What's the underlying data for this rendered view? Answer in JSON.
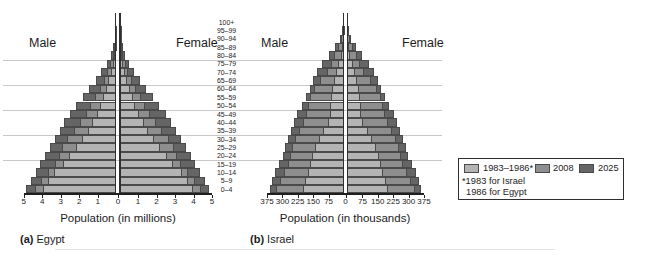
{
  "figure": {
    "age_groups": [
      "100+",
      "95–99",
      "90–94",
      "85–89",
      "80–84",
      "75–79",
      "70–74",
      "65–69",
      "60–64",
      "55–59",
      "50–54",
      "45–49",
      "40–44",
      "35–39",
      "30–34",
      "25–29",
      "20–24",
      "15–19",
      "10–14",
      "5–9",
      "0–4"
    ],
    "panels": [
      {
        "caption_prefix": "(a)",
        "caption": "Egypt",
        "male_label": "Male",
        "female_label": "Female",
        "xlabel": "Population (in millions)"
      },
      {
        "caption_prefix": "(b)",
        "caption": "Israel",
        "male_label": "Male",
        "female_label": "Female",
        "xlabel": "Population (in thousands)"
      }
    ],
    "legend": {
      "items": [
        {
          "label": "1983–1986*",
          "color": "#b4b4b4"
        },
        {
          "label": "2008",
          "color": "#8e8e8e"
        },
        {
          "label": "2025",
          "color": "#656565"
        }
      ],
      "footnote_line1": "*1983 for Israel",
      "footnote_line2": "1986 for Egypt"
    }
  },
  "chart_data": [
    {
      "type": "bar",
      "subtype": "population-pyramid",
      "id": "egypt",
      "title": "(a) Egypt",
      "xlabel": "Population (in millions)",
      "unit": "millions of persons per sex",
      "age_groups_order": "oldest-to-youngest",
      "age_groups": [
        "100+",
        "95–99",
        "90–94",
        "85–89",
        "80–84",
        "75–79",
        "70–74",
        "65–69",
        "60–64",
        "55–59",
        "50–54",
        "45–49",
        "40–44",
        "35–39",
        "30–34",
        "25–29",
        "20–24",
        "15–19",
        "10–14",
        "5–9",
        "0–4"
      ],
      "x_tick_labels": [
        "5",
        "4",
        "3",
        "2",
        "1",
        "0",
        "1",
        "2",
        "3",
        "4",
        "5"
      ],
      "xlim_each_side": 5,
      "grid": "horizontal lines every 3 age groups",
      "series": [
        {
          "name": "1983–1986*",
          "color": "#b4b4b4",
          "values": [
            0.01,
            0.02,
            0.03,
            0.06,
            0.12,
            0.2,
            0.3,
            0.42,
            0.55,
            0.7,
            0.85,
            1.05,
            1.3,
            1.55,
            1.85,
            2.2,
            2.55,
            2.9,
            3.35,
            3.7,
            3.95
          ]
        },
        {
          "name": "2008",
          "color": "#8e8e8e",
          "values": [
            0.01,
            0.03,
            0.05,
            0.1,
            0.2,
            0.32,
            0.48,
            0.68,
            0.9,
            1.15,
            1.4,
            1.65,
            1.95,
            2.3,
            2.65,
            2.95,
            3.1,
            3.3,
            3.7,
            4.05,
            4.4
          ]
        },
        {
          "name": "2025",
          "color": "#656565",
          "values": [
            0.02,
            0.04,
            0.08,
            0.16,
            0.3,
            0.52,
            0.8,
            1.1,
            1.45,
            1.8,
            2.15,
            2.5,
            2.8,
            3.05,
            3.3,
            3.6,
            3.85,
            4.1,
            4.35,
            4.6,
            4.85
          ]
        }
      ],
      "note": "values apply to both male (left) and female (right) sides"
    },
    {
      "type": "bar",
      "subtype": "population-pyramid",
      "id": "israel",
      "title": "(b) Israel",
      "xlabel": "Population (in thousands)",
      "unit": "thousands of persons per sex",
      "age_groups_order": "oldest-to-youngest",
      "age_groups": [
        "100+",
        "95–99",
        "90–94",
        "85–89",
        "80–84",
        "75–79",
        "70–74",
        "65–69",
        "60–64",
        "55–59",
        "50–54",
        "45–49",
        "40–44",
        "35–39",
        "30–34",
        "25–29",
        "20–24",
        "15–19",
        "10–14",
        "5–9",
        "0–4"
      ],
      "x_tick_labels": [
        "375",
        "300",
        "225",
        "150",
        "75",
        "0",
        "75",
        "150",
        "225",
        "300",
        "375"
      ],
      "xlim_each_side": 375,
      "grid": "horizontal lines every 3 age groups",
      "series": [
        {
          "name": "1983–1986*",
          "color": "#b4b4b4",
          "values": [
            0.5,
            1,
            3,
            8,
            16,
            28,
            40,
            50,
            60,
            65,
            70,
            70,
            80,
            100,
            120,
            140,
            155,
            165,
            175,
            190,
            200
          ]
        },
        {
          "name": "2008",
          "color": "#8e8e8e",
          "values": [
            2,
            5,
            13,
            28,
            48,
            65,
            85,
            115,
            145,
            165,
            175,
            185,
            200,
            220,
            240,
            255,
            265,
            275,
            290,
            310,
            330
          ]
        },
        {
          "name": "2025",
          "color": "#656565",
          "values": [
            3,
            8,
            20,
            42,
            72,
            105,
            132,
            152,
            168,
            185,
            205,
            228,
            245,
            260,
            275,
            285,
            295,
            315,
            335,
            350,
            360
          ]
        }
      ],
      "note": "values apply to both male (left) and female (right) sides"
    }
  ]
}
